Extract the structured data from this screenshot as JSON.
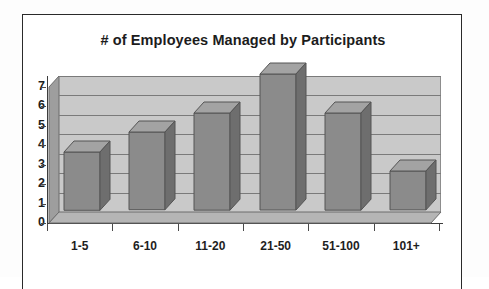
{
  "chart_data": {
    "type": "bar",
    "title": "# of Employees Managed by Participants",
    "xlabel": "",
    "ylabel": "",
    "categories": [
      "1-5",
      "6-10",
      "11-20",
      "21-50",
      "51-100",
      "101+"
    ],
    "values": [
      3,
      4,
      5,
      7,
      5,
      2
    ],
    "ylim": [
      0,
      7
    ],
    "yticks": [
      "0",
      "1",
      "2",
      "3",
      "4",
      "5",
      "6",
      "7"
    ],
    "grid": true,
    "legend": "none",
    "style": "3d-bar",
    "colors": {
      "bar_face": "#8b8b8b",
      "bar_side": "#6e6e6e",
      "bar_top": "#a3a3a3",
      "plot_background": "#c9c9c9",
      "gridline": "#7a7a7a",
      "axis": "#3c3c3c",
      "text": "#1e1e1e",
      "frame": "#2a2a2a",
      "page_background": "#ffffff"
    }
  }
}
